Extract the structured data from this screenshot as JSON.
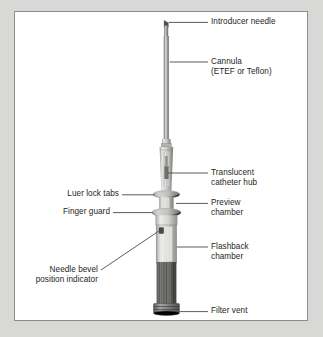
{
  "figure": {
    "background_color": "#d8d8d6",
    "panel_color": "#ffffff",
    "border_color": "#8d8d8d",
    "text_color": "#231f20",
    "leader_color": "#4a4a4a"
  },
  "labels": {
    "introducer_needle": "Introducer needle",
    "cannula": "Cannula\n(ETEF or Teflon)",
    "translucent_catheter_hub": "Translucent\ncatheter hub",
    "preview_chamber": "Preview\nchamber",
    "flashback_chamber": "Flashback\nchamber",
    "filter_vent": "Filter vent",
    "luer_lock_tabs": "Luer lock tabs",
    "finger_guard": "Finger guard",
    "needle_bevel_position_indicator": "Needle bevel\nposition indicator"
  },
  "device": {
    "name": "iv-catheter",
    "parts": [
      "introducer-needle",
      "cannula",
      "translucent-catheter-hub",
      "luer-lock-tabs",
      "preview-chamber",
      "finger-guard",
      "needle-bevel-position-indicator",
      "flashback-chamber",
      "filter-vent"
    ],
    "colors": {
      "needle": "#8a8a8a",
      "cannula_body": "#c9c9c7",
      "cannula_edge": "#6e6e6e",
      "hub_light": "#e2e2e0",
      "hub_mid": "#bdbdbb",
      "hub_dark": "#8b8b89",
      "flange": "#a9a9a7",
      "chamber_light": "#dcdcda",
      "barrel_dark": "#5d5d5b",
      "barrel_mid": "#7a7a78",
      "cap": "#6a6a68"
    }
  }
}
